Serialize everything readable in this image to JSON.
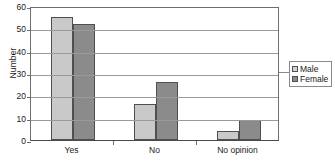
{
  "chart_data": {
    "type": "bar",
    "title": "",
    "subtitle": "",
    "xlabel": "",
    "ylabel": "Number",
    "categories": [
      "Yes",
      "No",
      "No opinion"
    ],
    "series": [
      {
        "name": "Male",
        "values": [
          55,
          16,
          4
        ],
        "color": "#c9c9c9"
      },
      {
        "name": "Female",
        "values": [
          52,
          26,
          9
        ],
        "color": "#8b8b8b"
      }
    ],
    "ylim": [
      0,
      60
    ],
    "ytick_labels": [
      "0",
      "10",
      "20",
      "30",
      "40",
      "50",
      "60"
    ],
    "ytick_values": [
      0,
      10,
      20,
      30,
      40,
      50,
      60
    ],
    "grid": "horizontal",
    "legend_position": "right",
    "legend_entries": [
      "Male",
      "Female"
    ]
  }
}
